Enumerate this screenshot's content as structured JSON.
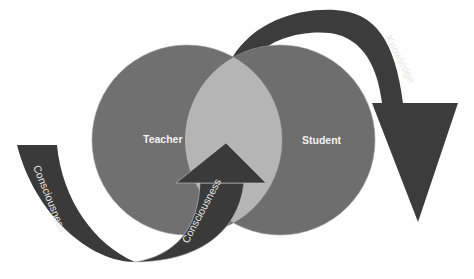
{
  "diagram": {
    "type": "venn-with-cycle-arrows",
    "circles": [
      {
        "label": "Teacher",
        "color": "#6e6e6e"
      },
      {
        "label": "Student",
        "color": "#6e6e6e"
      }
    ],
    "overlap_color": "#b4b4b4",
    "arrows": [
      {
        "label": "Knowledge",
        "direction": "from Teacher/Student overlap over the top to the right, pointing down",
        "color": "#3a3a3a"
      },
      {
        "label": "Consciousness",
        "direction": "left band curving down from the left side",
        "color": "#3a3a3a"
      },
      {
        "label": "Consciousness",
        "direction": "curving up into the overlap, pointing up",
        "color": "#3a3a3a"
      }
    ]
  }
}
